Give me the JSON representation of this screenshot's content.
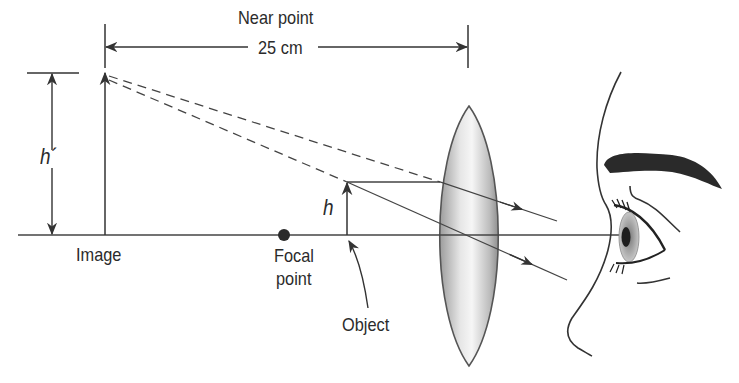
{
  "diagram": {
    "labels": {
      "near_point": "Near point",
      "distance": "25 cm",
      "image_height": "h´",
      "object_height": "h",
      "image": "Image",
      "focal_point_line1": "Focal",
      "focal_point_line2": "point",
      "object": "Object"
    },
    "colors": {
      "line": "#3a3a3a",
      "lens_edge": "#555555",
      "lens_fill_light": "#f4f4f4",
      "lens_fill_dark": "#a8a8a8",
      "eyebrow": "#2a2a2a",
      "iris": "#9a9a9a",
      "pupil": "#222222"
    },
    "elements": [
      "optical-axis",
      "image-arrow",
      "object-arrow",
      "converging-lens",
      "focal-point",
      "light-rays",
      "virtual-rays",
      "eye-profile"
    ]
  }
}
